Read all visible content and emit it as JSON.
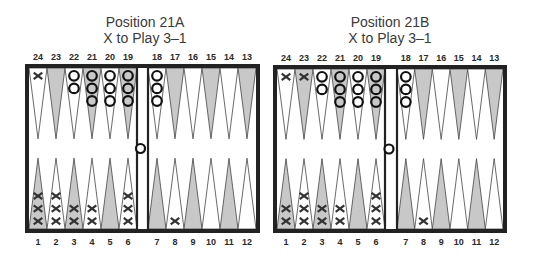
{
  "colors": {
    "border": "#222222",
    "shaded_point": "#c8c8c8",
    "light_point": "#ffffff",
    "checker_stroke": "#111111",
    "text": "#2a2a2a"
  },
  "boards": [
    {
      "id": "A",
      "title": "Position 21A",
      "subtitle": "X to Play 3–1",
      "box": {
        "x": 25,
        "y": 64,
        "w": 235,
        "h": 169
      },
      "bar": {
        "x1": 137,
        "x2": 148
      },
      "top_labels": [
        "24",
        "23",
        "22",
        "21",
        "20",
        "19",
        "18",
        "17",
        "16",
        "15",
        "14",
        "13"
      ],
      "bottom_labels": [
        "1",
        "2",
        "3",
        "4",
        "5",
        "6",
        "7",
        "8",
        "9",
        "10",
        "11",
        "12"
      ],
      "points": {
        "24": {
          "X": 1
        },
        "23": {},
        "22": {
          "O": 2
        },
        "21": {
          "O": 3
        },
        "20": {
          "O": 3
        },
        "19": {
          "O": 3
        },
        "18": {
          "O": 3
        },
        "17": {},
        "16": {},
        "15": {},
        "14": {},
        "13": {},
        "1": {
          "X": 3
        },
        "2": {
          "X": 3
        },
        "3": {
          "X": 2
        },
        "4": {
          "X": 2
        },
        "5": {},
        "6": {
          "X": 3
        },
        "7": {},
        "8": {
          "X": 1
        },
        "9": {},
        "10": {},
        "11": {},
        "12": {}
      },
      "bar_checkers": {
        "O": 1
      }
    },
    {
      "id": "B",
      "title": "Position 21B",
      "subtitle": "X to Play 3–1",
      "box": {
        "x": 273,
        "y": 65,
        "w": 234,
        "h": 168
      },
      "bar": {
        "x1": 385,
        "x2": 397
      },
      "top_labels": [
        "24",
        "23",
        "22",
        "21",
        "20",
        "19",
        "18",
        "17",
        "16",
        "15",
        "14",
        "13"
      ],
      "bottom_labels": [
        "1",
        "2",
        "3",
        "4",
        "5",
        "6",
        "7",
        "8",
        "9",
        "10",
        "11",
        "12"
      ],
      "points": {
        "24": {
          "X": 1
        },
        "23": {
          "X": 1
        },
        "22": {
          "O": 2
        },
        "21": {
          "O": 3
        },
        "20": {
          "O": 3
        },
        "19": {
          "O": 3
        },
        "18": {
          "O": 3
        },
        "17": {},
        "16": {},
        "15": {},
        "14": {},
        "13": {},
        "1": {
          "X": 2
        },
        "2": {
          "X": 3
        },
        "3": {
          "X": 2
        },
        "4": {
          "X": 2
        },
        "5": {},
        "6": {
          "X": 3
        },
        "7": {},
        "8": {
          "X": 1
        },
        "9": {},
        "10": {},
        "11": {},
        "12": {}
      },
      "bar_checkers": {
        "O": 1
      }
    }
  ],
  "shaded_points_top": [
    "23",
    "21",
    "19",
    "17",
    "15",
    "13"
  ],
  "shaded_points_bottom": [
    "1",
    "3",
    "5",
    "7",
    "9",
    "11"
  ]
}
